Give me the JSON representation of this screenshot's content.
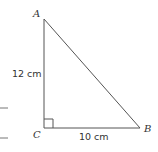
{
  "diagram": {
    "vertices": {
      "A": {
        "label": "A",
        "x": 44,
        "y": 19
      },
      "B": {
        "label": "B",
        "x": 140,
        "y": 128
      },
      "C": {
        "label": "C",
        "x": 44,
        "y": 128
      }
    },
    "sides": {
      "AC": {
        "length_label": "12 cm"
      },
      "CB": {
        "length_label": "10 cm"
      },
      "AB": {
        "length_label": ""
      }
    },
    "right_angle_at": "C",
    "colors": {
      "stroke": "#555555",
      "text": "#333333",
      "background": "#ffffff"
    }
  }
}
